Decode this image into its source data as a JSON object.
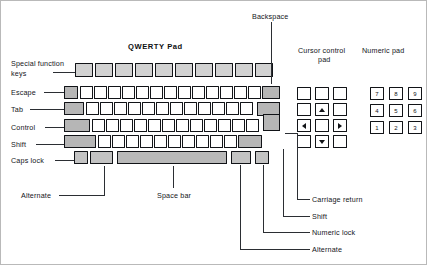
{
  "diagram": {
    "title_qwerty": "QWERTY Pad",
    "title_cursor_line1": "Cursor control",
    "title_cursor_line2": "pad",
    "title_numeric": "Numeric pad",
    "title_backspace": "Backspace"
  },
  "left_callouts": {
    "special_function_line1": "Special function",
    "special_function_line2": "keys",
    "escape": "Escape",
    "tab": "Tab",
    "control": "Control",
    "shift": "Shift",
    "caps_lock": "Caps lock"
  },
  "bottom_callouts": {
    "alternate_left": "Alternate",
    "space_bar": "Space bar"
  },
  "right_callouts": {
    "carriage_return": "Carriage return",
    "shift": "Shift",
    "numeric_lock": "Numeric lock",
    "alternate": "Alternate"
  },
  "numeric_pad": {
    "rows": [
      [
        "7",
        "8",
        "9"
      ],
      [
        "4",
        "5",
        "6"
      ],
      [
        "1",
        "2",
        "3"
      ]
    ]
  },
  "cursor_pad": {
    "up": "arrow-up",
    "down": "arrow-down",
    "left": "arrow-left",
    "right": "arrow-right"
  },
  "colors": {
    "key_outline": "#111317",
    "key_face": "#ffffff",
    "key_shaded": "#b6b6b6",
    "key_function": "#d2d2d2",
    "space_bar": "#b9b9b9",
    "text": "#14161a",
    "background": "#ffffff"
  }
}
